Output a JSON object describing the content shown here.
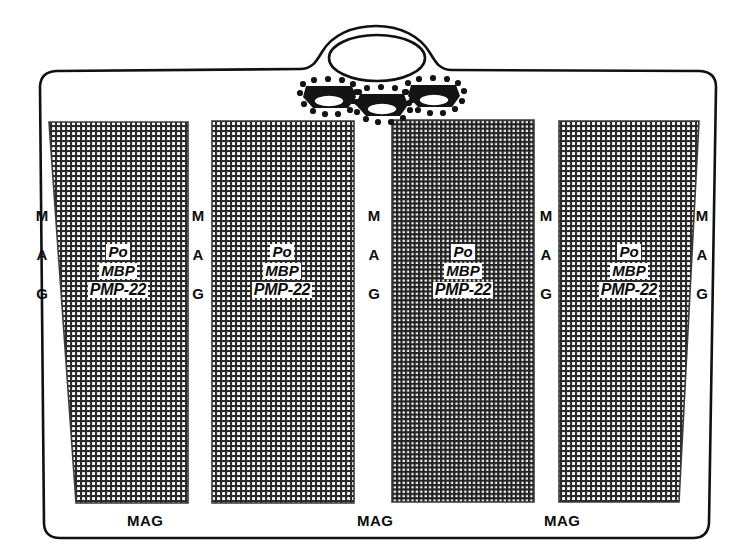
{
  "figure": {
    "background_color": "#ffffff",
    "ink_color": "#111111"
  },
  "outline": {
    "name": "cell-body-outline",
    "description": "rounded trapezoid enclosing the internode blocks with a domed nuclear bulge at the top"
  },
  "nuclear_dome": {
    "name": "nuclear-dome",
    "description": "arched bulge on the top edge containing an oval nucleus"
  },
  "nucleus": {
    "name": "nucleus-oval",
    "shape": "ellipse"
  },
  "clusters": [
    {
      "name": "ribosome-cluster-left"
    },
    {
      "name": "ribosome-cluster-center"
    },
    {
      "name": "ribosome-cluster-right"
    }
  ],
  "blocks": [
    {
      "name": "internode-block-1",
      "shade": "#9a9a9a",
      "genes": {
        "po": "Po",
        "mbp": "MBP",
        "pmp22": "PMP-22"
      }
    },
    {
      "name": "internode-block-2",
      "shade": "#9a9a9a",
      "genes": {
        "po": "Po",
        "mbp": "MBP",
        "pmp22": "PMP-22"
      }
    },
    {
      "name": "internode-block-3",
      "shade": "#8a8a8a",
      "genes": {
        "po": "Po",
        "mbp": "MBP",
        "pmp22": "PMP-22"
      }
    },
    {
      "name": "internode-block-4",
      "shade": "#9a9a9a",
      "genes": {
        "po": "Po",
        "mbp": "MBP",
        "pmp22": "PMP-22"
      }
    }
  ],
  "mag_vertical": [
    {
      "name": "mag-vertical-1",
      "m": "M",
      "a": "A",
      "g": "G"
    },
    {
      "name": "mag-vertical-2",
      "m": "M",
      "a": "A",
      "g": "G"
    },
    {
      "name": "mag-vertical-3",
      "m": "M",
      "a": "A",
      "g": "G"
    },
    {
      "name": "mag-vertical-4",
      "m": "M",
      "a": "A",
      "g": "G"
    },
    {
      "name": "mag-vertical-5",
      "m": "M",
      "a": "A",
      "g": "G"
    }
  ],
  "mag_horizontal": [
    {
      "name": "mag-horizontal-1",
      "label": "MAG"
    },
    {
      "name": "mag-horizontal-2",
      "label": "MAG"
    },
    {
      "name": "mag-horizontal-3",
      "label": "MAG"
    }
  ]
}
